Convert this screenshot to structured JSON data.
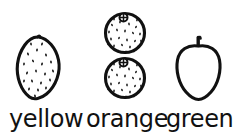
{
  "page": {
    "background_color": "#ffffff",
    "ink_color": "#111111",
    "style": "black-and-white hand-drawn line art"
  },
  "items": [
    {
      "id": "yellow",
      "label": "yellow",
      "fruit": "lemon",
      "icon": "lemon-icon",
      "count": 1,
      "texture": "stippled dots",
      "color_word": "yellow"
    },
    {
      "id": "orange",
      "label": "orange",
      "fruit": "orange",
      "icon": "orange-icon",
      "count": 2,
      "texture": "stippled dots with calyx star",
      "color_word": "orange"
    },
    {
      "id": "green",
      "label": "green",
      "fruit": "apple",
      "icon": "apple-icon",
      "count": 1,
      "texture": "plain outline with stem",
      "color_word": "green"
    }
  ],
  "labels": {
    "yellow": "yellow",
    "orange": "orange",
    "green": "green"
  }
}
